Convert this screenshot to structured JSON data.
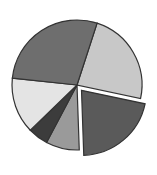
{
  "chart_data": {
    "type": "pie",
    "title": "",
    "legend": [],
    "exploded_index": 1,
    "center": [
      77,
      85
    ],
    "radius": 65,
    "start_angle_deg": 18,
    "slices": [
      {
        "name": "slice-1",
        "value": 23.3,
        "color": "#c8c8c8"
      },
      {
        "name": "slice-2",
        "value": 21.1,
        "color": "#5a5a5a",
        "exploded": true
      },
      {
        "name": "slice-3",
        "value": 8.3,
        "color": "#9a9a9a"
      },
      {
        "name": "slice-4",
        "value": 5.0,
        "color": "#3c3c3c"
      },
      {
        "name": "slice-5",
        "value": 13.9,
        "color": "#e4e4e4"
      },
      {
        "name": "slice-6",
        "value": 28.3,
        "color": "#6e6e6e"
      }
    ]
  }
}
